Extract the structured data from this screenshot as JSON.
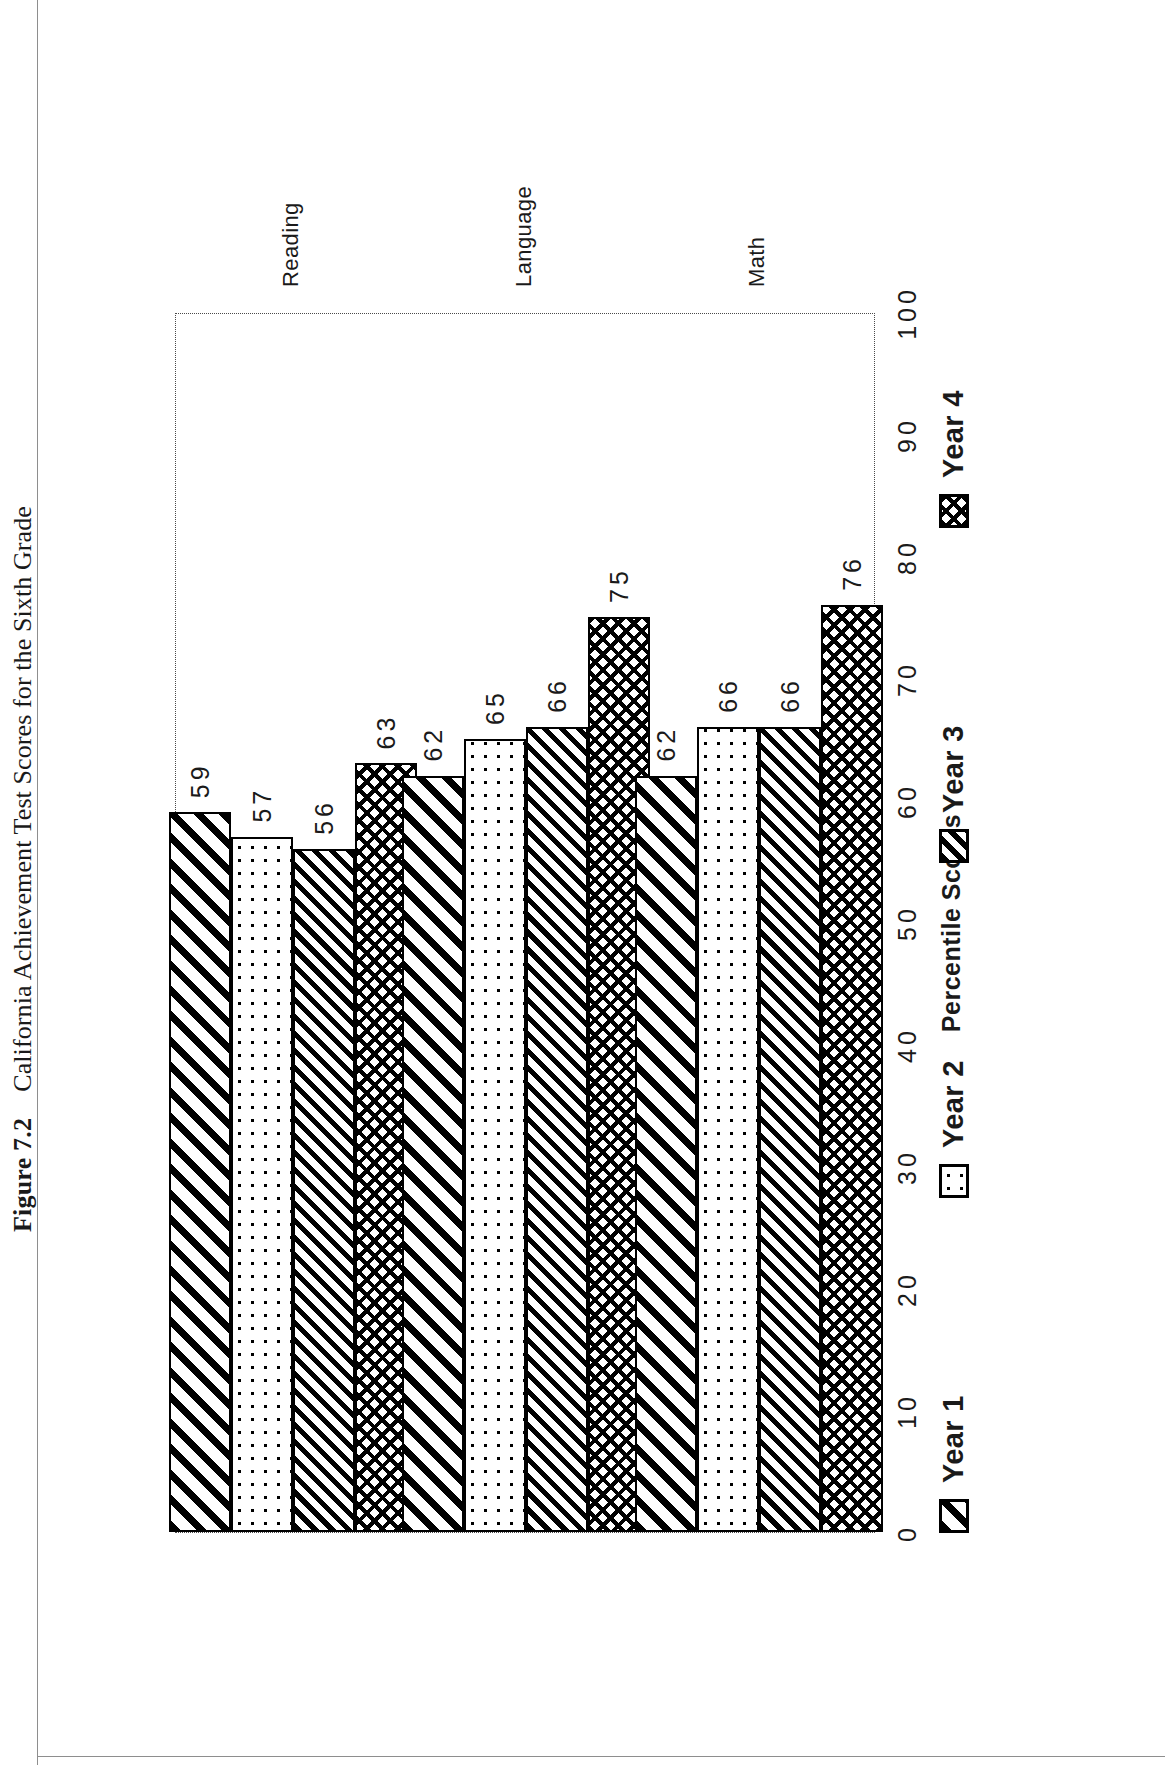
{
  "caption": {
    "number": "Figure 7.2",
    "text": "California Achievement Test Scores for the Sixth Grade"
  },
  "chart_data": {
    "type": "bar",
    "orientation": "vertical",
    "title": "",
    "xlabel": "",
    "ylabel": "Percentile Scores",
    "ylim": [
      0,
      100
    ],
    "yticks": [
      "0",
      "10",
      "20",
      "30",
      "40",
      "50",
      "60",
      "70",
      "80",
      "90",
      "100"
    ],
    "grid": false,
    "legend_position": "bottom",
    "categories": [
      "Reading",
      "Language",
      "Math"
    ],
    "series": [
      {
        "name": "Year 1",
        "pattern": "diagonal-stripe",
        "values": [
          59,
          62,
          62
        ]
      },
      {
        "name": "Year 2",
        "pattern": "dotted",
        "values": [
          57,
          65,
          66
        ]
      },
      {
        "name": "Year 3",
        "pattern": "dense-diagonal",
        "values": [
          56,
          66,
          66
        ]
      },
      {
        "name": "Year 4",
        "pattern": "crosshatch",
        "values": [
          63,
          75,
          76
        ]
      }
    ],
    "data_labels": {
      "Reading": [
        "59",
        "57",
        "56",
        "63"
      ],
      "Language": [
        "62",
        "65",
        "66",
        "75"
      ],
      "Math": [
        "62",
        "66",
        "66",
        "76"
      ]
    }
  }
}
